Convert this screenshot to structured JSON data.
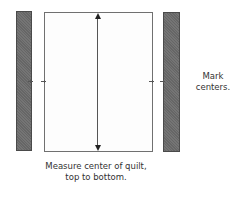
{
  "diagram": {
    "type": "quilt-border-measuring-illustration",
    "colors": {
      "border_strip_fill": "#6c6c6c",
      "border_strip_outline": "#4a4a4a",
      "quilt_fill": "#fdfdfd",
      "quilt_outline": "#707070",
      "arrow": "#222222",
      "text": "#333333"
    },
    "elements": {
      "left_strip": {
        "role": "border strip"
      },
      "quilt": {
        "role": "quilt top"
      },
      "right_strip": {
        "role": "border strip"
      },
      "measure_arrow": {
        "direction": "vertical",
        "ends": [
          "up",
          "down"
        ]
      },
      "center_marks": {
        "count": 4
      }
    },
    "labels": {
      "mark_line1": "Mark",
      "mark_line2": "centers.",
      "measure_line1": "Measure center of quilt,",
      "measure_line2": "top to bottom."
    }
  }
}
